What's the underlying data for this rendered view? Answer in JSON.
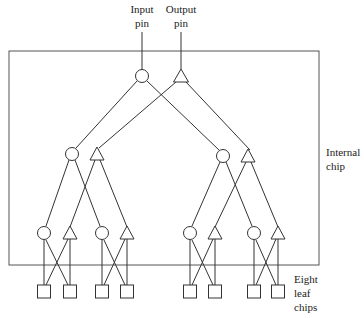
{
  "diagram": {
    "labels": {
      "input_pin": [
        "Input",
        "pin"
      ],
      "output_pin": [
        "Output",
        "pin"
      ],
      "internal_chip": [
        "Internal",
        "chip"
      ],
      "leaf_chips": [
        "Eight",
        "leaf",
        "chips"
      ]
    },
    "legend": {
      "circle": "input node",
      "triangle": "output node",
      "square": "leaf chip"
    },
    "colors": {
      "stroke": "#333333",
      "background": "#ffffff"
    },
    "counts": {
      "leaf_chips": 8,
      "tree_levels": 3
    }
  }
}
